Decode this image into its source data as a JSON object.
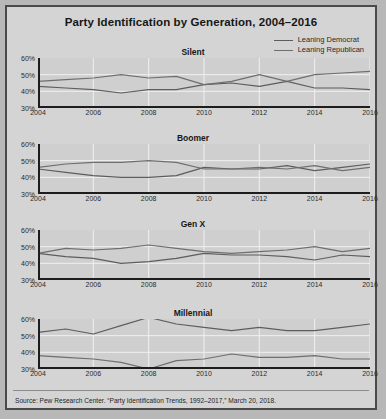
{
  "figure": {
    "title": "Party Identification by Generation, 2004–2016",
    "source": "Source: Pew Research Center. “Party Identification Trends, 1992–2017,” March 20, 2018.",
    "background_color": "#d4d4d4",
    "plot_background_color": "#cfcfcf",
    "border_color": "#4a4a4a"
  },
  "legend": {
    "position": "top-right",
    "entries": [
      {
        "label": "Leaning Democrat",
        "color": "#5d5d5d"
      },
      {
        "label": "Leaning Republican",
        "color": "#6e6e6e"
      }
    ]
  },
  "axes": {
    "ytick_labels": [
      "60%",
      "50%",
      "40%",
      "30%"
    ],
    "xtick_labels": [
      "2004",
      "2006",
      "2008",
      "2010",
      "2012",
      "2014",
      "2016"
    ],
    "ylim": [
      30,
      60
    ],
    "xlim": [
      2004,
      2016
    ],
    "grid": true
  },
  "chart_data": [
    {
      "type": "line",
      "title": "Silent",
      "xlabel": "",
      "ylabel": "",
      "ylim": [
        30,
        60
      ],
      "xlim": [
        2004,
        2016
      ],
      "grid": true,
      "legend_position": "figure top-right",
      "x": [
        2004,
        2005,
        2006,
        2007,
        2008,
        2009,
        2010,
        2011,
        2012,
        2013,
        2014,
        2015,
        2016
      ],
      "series": [
        {
          "name": "Leaning Democrat",
          "color": "#5d5d5d",
          "values": [
            43,
            42,
            41,
            39,
            41,
            41,
            44,
            45,
            43,
            46,
            42,
            42,
            41
          ]
        },
        {
          "name": "Leaning Republican",
          "color": "#6e6e6e",
          "values": [
            46,
            47,
            48,
            50,
            48,
            49,
            44,
            46,
            50,
            46,
            50,
            51,
            52
          ]
        }
      ]
    },
    {
      "type": "line",
      "title": "Boomer",
      "xlabel": "",
      "ylabel": "",
      "ylim": [
        30,
        60
      ],
      "xlim": [
        2004,
        2016
      ],
      "grid": true,
      "x": [
        2004,
        2005,
        2006,
        2007,
        2008,
        2009,
        2010,
        2011,
        2012,
        2013,
        2014,
        2015,
        2016
      ],
      "series": [
        {
          "name": "Leaning Democrat",
          "color": "#5d5d5d",
          "values": [
            45,
            43,
            41,
            40,
            40,
            41,
            46,
            45,
            45,
            47,
            44,
            46,
            48
          ]
        },
        {
          "name": "Leaning Republican",
          "color": "#6e6e6e",
          "values": [
            46,
            48,
            49,
            49,
            50,
            49,
            45,
            45,
            46,
            45,
            47,
            44,
            46
          ]
        }
      ]
    },
    {
      "type": "line",
      "title": "Gen X",
      "xlabel": "",
      "ylabel": "",
      "ylim": [
        30,
        60
      ],
      "xlim": [
        2004,
        2016
      ],
      "grid": true,
      "x": [
        2004,
        2005,
        2006,
        2007,
        2008,
        2009,
        2010,
        2011,
        2012,
        2013,
        2014,
        2015,
        2016
      ],
      "series": [
        {
          "name": "Leaning Democrat",
          "color": "#5d5d5d",
          "values": [
            46,
            44,
            43,
            40,
            41,
            43,
            46,
            45,
            45,
            44,
            42,
            45,
            44
          ]
        },
        {
          "name": "Leaning Republican",
          "color": "#6e6e6e",
          "values": [
            46,
            49,
            48,
            49,
            51,
            49,
            47,
            46,
            47,
            48,
            50,
            47,
            49
          ]
        }
      ]
    },
    {
      "type": "line",
      "title": "Millennial",
      "xlabel": "",
      "ylabel": "",
      "ylim": [
        30,
        60
      ],
      "xlim": [
        2004,
        2016
      ],
      "grid": true,
      "x": [
        2004,
        2005,
        2006,
        2007,
        2008,
        2009,
        2010,
        2011,
        2012,
        2013,
        2014,
        2015,
        2016
      ],
      "series": [
        {
          "name": "Leaning Democrat",
          "color": "#5d5d5d",
          "values": [
            52,
            54,
            51,
            56,
            61,
            57,
            55,
            53,
            55,
            53,
            53,
            55,
            57
          ]
        },
        {
          "name": "Leaning Republican",
          "color": "#6e6e6e",
          "values": [
            38,
            37,
            36,
            34,
            30,
            35,
            36,
            39,
            37,
            37,
            38,
            36,
            36
          ]
        }
      ]
    }
  ]
}
